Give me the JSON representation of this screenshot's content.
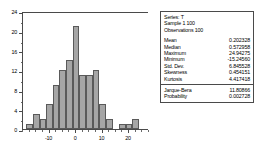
{
  "chart_data": {
    "type": "bar",
    "title": "",
    "xlabel": "",
    "ylabel": "",
    "xlim": [
      -20,
      27.5
    ],
    "ylim": [
      0,
      24
    ],
    "grid": false,
    "legend": "none",
    "bin_width": 2.5,
    "categories": [
      "-17.5",
      "-15.0",
      "-12.5",
      "-10.0",
      "-7.5",
      "-5.0",
      "-2.5",
      "0.0",
      "2.5",
      "5.0",
      "7.5",
      "10.0",
      "12.5",
      "15.0",
      "17.5",
      "20.0",
      "22.5"
    ],
    "bin_starts": [
      -18.75,
      -16.25,
      -13.75,
      -11.25,
      -8.75,
      -6.25,
      -3.75,
      -1.25,
      1.25,
      3.75,
      6.25,
      8.75,
      11.25,
      13.75,
      16.25,
      18.75,
      21.25
    ],
    "values": [
      1,
      3,
      2,
      5,
      9,
      12,
      14,
      21,
      11,
      11,
      12,
      5,
      2,
      0,
      1,
      1,
      2
    ],
    "y_ticks": [
      0,
      4,
      8,
      12,
      16,
      20,
      24
    ],
    "y_tick_labels": [
      "0",
      "4",
      "8",
      "12",
      "16",
      "20",
      "24"
    ],
    "x_ticks": [
      -10,
      0,
      10,
      20
    ],
    "x_tick_labels": [
      "-10",
      "0",
      "10",
      "20"
    ],
    "bar_color": "#a6a6a6",
    "bar_edge_color": "#5a5a5a",
    "axis_color": "#4a4a4a"
  },
  "stats": {
    "series_line": "Series: T",
    "sample_line": "Sample 1 100",
    "observations_line": "Observations 100",
    "rows": [
      {
        "key": "Mean",
        "value": "0.202328"
      },
      {
        "key": "Median",
        "value": "0.572958"
      },
      {
        "key": "Maximum",
        "value": "24.94275"
      },
      {
        "key": "Minimum",
        "value": "-15.24560"
      },
      {
        "key": "Std. Dev.",
        "value": "6.845528"
      },
      {
        "key": "Skewness",
        "value": "0.454151"
      },
      {
        "key": "Kurtosis",
        "value": "4.417418"
      }
    ],
    "test_rows": [
      {
        "key": "Jarque-Bera",
        "value": "11.80866"
      },
      {
        "key": "Probability",
        "value": "0.002728"
      }
    ]
  }
}
